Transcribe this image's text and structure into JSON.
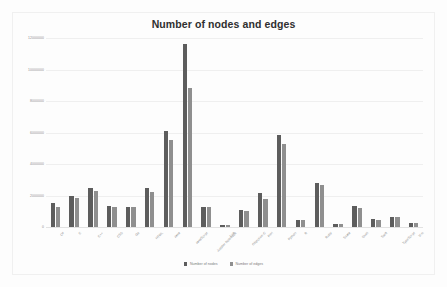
{
  "chart": {
    "title": "Number of nodes and edges"
  },
  "legend": {
    "items": [
      {
        "label": "Number of nodes",
        "color": "#5d5d5d"
      },
      {
        "label": "Number of edges",
        "color": "#8f8f8f"
      }
    ]
  },
  "chart_data": {
    "type": "bar",
    "title": "Number of nodes and edges",
    "xlabel": "",
    "ylabel": "",
    "ylim": [
      0,
      12000000
    ],
    "yticks": [
      0,
      2000000,
      4000000,
      6000000,
      8000000,
      10000000,
      12000000
    ],
    "ytick_labels": [
      "0",
      "2000000",
      "4000000",
      "6000000",
      "8000000",
      "10000000",
      "12000000"
    ],
    "grid": true,
    "legend_position": "bottom",
    "orientation": "vertical",
    "categories": [
      "C#",
      "C",
      "C++",
      "CSS",
      "Go",
      "HTML",
      "Java",
      "JavaScript",
      "Jupyter Notebook",
      "Lua",
      "Objective-C",
      "Perl",
      "Python",
      "R",
      "Ruby",
      "Scala",
      "Shell",
      "Swift",
      "TypeScript",
      "Vim"
    ],
    "series": [
      {
        "name": "Number of nodes",
        "color": "#5d5d5d",
        "values": [
          1500000,
          2000000,
          2450000,
          1350000,
          1250000,
          2500000,
          6100000,
          11600000,
          1300000,
          120000,
          1050000,
          2150000,
          5850000,
          450000,
          2800000,
          200000,
          1350000,
          500000,
          650000,
          230000
        ]
      },
      {
        "name": "Number of edges",
        "color": "#8f8f8f",
        "values": [
          1300000,
          1850000,
          2300000,
          1250000,
          1250000,
          2200000,
          5500000,
          8800000,
          1250000,
          130000,
          1000000,
          1800000,
          5250000,
          430000,
          2650000,
          210000,
          1200000,
          470000,
          620000,
          240000
        ]
      }
    ]
  }
}
